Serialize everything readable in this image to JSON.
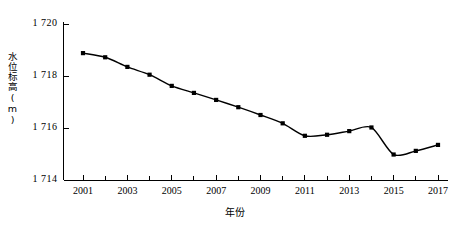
{
  "chart_data": {
    "type": "line",
    "title": "",
    "xlabel": "年份",
    "ylabel": "水位标高(m)",
    "xlim": [
      2001,
      2017
    ],
    "ylim": [
      1714,
      1720
    ],
    "grid": false,
    "legend": "none",
    "marker": "filled-square",
    "line_color": "#000000",
    "marker_color": "#000000",
    "axis_color": "#000000",
    "x": [
      2001,
      2002,
      2003,
      2004,
      2005,
      2006,
      2007,
      2008,
      2009,
      2010,
      2011,
      2012,
      2013,
      2014,
      2015,
      2016,
      2017
    ],
    "values": [
      1718.88,
      1718.72,
      1718.35,
      1718.05,
      1717.62,
      1717.35,
      1717.08,
      1716.8,
      1716.5,
      1716.18,
      1715.7,
      1715.74,
      1715.88,
      1716.02,
      1714.98,
      1715.12,
      1715.35
    ],
    "series": [
      {
        "name": "水位标高",
        "values": [
          1718.88,
          1718.72,
          1718.35,
          1718.05,
          1717.62,
          1717.35,
          1717.08,
          1716.8,
          1716.5,
          1716.18,
          1715.7,
          1715.74,
          1715.88,
          1716.02,
          1714.98,
          1715.12,
          1715.35
        ]
      }
    ],
    "ytick_labels": [
      "1 720",
      "1 718",
      "1 716",
      "1 714"
    ],
    "ytick_values": [
      1720,
      1718,
      1716,
      1714
    ],
    "xtick_labels": [
      "2001",
      "2003",
      "2005",
      "2007",
      "2009",
      "2011",
      "2013",
      "2015",
      "2017"
    ],
    "xtick_values": [
      2001,
      2003,
      2005,
      2007,
      2009,
      2011,
      2013,
      2015,
      2017
    ],
    "xtick_minor_values": [
      2002,
      2004,
      2006,
      2008,
      2010,
      2012,
      2014,
      2016
    ]
  }
}
